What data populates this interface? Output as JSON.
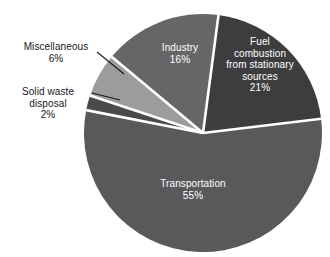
{
  "chart_data": {
    "type": "pie",
    "title": "",
    "subtitle": "",
    "xlabel": "",
    "ylabel": "",
    "grid": false,
    "legend_position": "none",
    "units": "percent",
    "total": 100,
    "categories": [
      "Transportation",
      "Fuel combustion from stationary sources",
      "Industry",
      "Miscellaneous",
      "Solid waste disposal"
    ],
    "values": [
      55,
      21,
      16,
      6,
      2
    ],
    "labels": [
      "55%",
      "21%",
      "16%",
      "6%",
      "2%"
    ],
    "colors": [
      "#59595c",
      "#3d3d3f",
      "#666668",
      "#9c9c9e",
      "#4a4a4c"
    ],
    "slices": [
      {
        "name": "Transportation",
        "value": 55,
        "label": "55%",
        "color": "#59595c",
        "label_placement": "inside"
      },
      {
        "name": "Fuel combustion from stationary sources",
        "name_lines": [
          "Fuel",
          "combustion",
          "from stationary",
          "sources"
        ],
        "value": 21,
        "label": "21%",
        "color": "#3d3d3f",
        "label_placement": "inside"
      },
      {
        "name": "Industry",
        "value": 16,
        "label": "16%",
        "color": "#666668",
        "label_placement": "inside"
      },
      {
        "name": "Miscellaneous",
        "value": 6,
        "label": "6%",
        "color": "#9c9c9e",
        "label_placement": "outside-leader-line"
      },
      {
        "name": "Solid waste disposal",
        "name_lines": [
          "Solid waste",
          "disposal"
        ],
        "value": 2,
        "label": "2%",
        "color": "#4a4a4c",
        "label_placement": "outside-leader-line"
      }
    ]
  },
  "labels": {
    "transportation_name": "Transportation",
    "transportation_pct": "55%",
    "fuel_line1": "Fuel",
    "fuel_line2": "combustion",
    "fuel_line3": "from stationary",
    "fuel_line4": "sources",
    "fuel_pct": "21%",
    "industry_name": "Industry",
    "industry_pct": "16%",
    "misc_name": "Miscellaneous",
    "misc_pct": "6%",
    "solid_line1": "Solid waste",
    "solid_line2": "disposal",
    "solid_pct": "2%"
  }
}
